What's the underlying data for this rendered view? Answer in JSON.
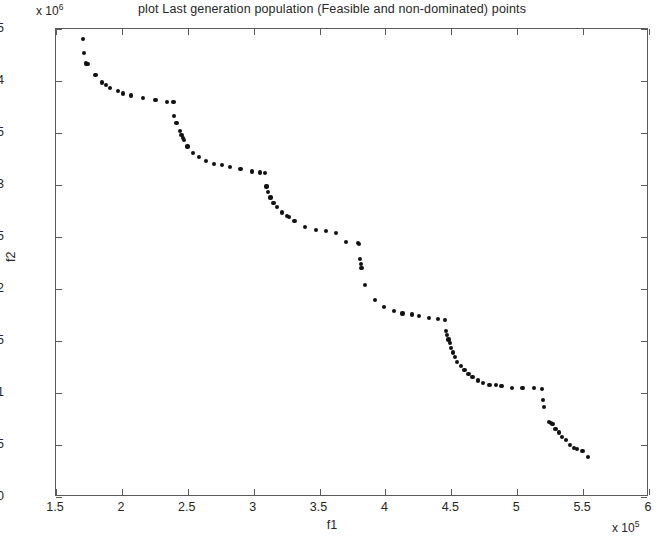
{
  "chart_data": {
    "type": "scatter",
    "title": "plot Last generation population (Feasible and non-dominated) points",
    "xlabel": "f1",
    "ylabel": "f2",
    "x_exponent_label": "x 10",
    "x_exponent_power": "5",
    "y_exponent_label": "x 10",
    "y_exponent_power": "6",
    "xlim": [
      1.5,
      6
    ],
    "ylim": [
      0,
      4.5
    ],
    "xticks": [
      1.5,
      2,
      2.5,
      3,
      3.5,
      4,
      4.5,
      5,
      5.5,
      6
    ],
    "xtick_labels": [
      "1.5",
      "2",
      "2.5",
      "3",
      "3.5",
      "4",
      "4.5",
      "5",
      "5.5",
      "6"
    ],
    "yticks": [
      0,
      0.5,
      1,
      1.5,
      2,
      2.5,
      3,
      3.5,
      4,
      4.5
    ],
    "ytick_labels": [
      "0",
      "0.5",
      "1",
      "1.5",
      "2",
      "2.5",
      "3",
      "3.5",
      "4",
      "4.5"
    ],
    "grid": false,
    "legend": null,
    "marker": "filled-circle",
    "marker_color": "#111111",
    "x_units": "1e5",
    "y_units": "1e6",
    "n_points": 96,
    "points": [
      [
        1.703,
        4.405
      ],
      [
        1.71,
        4.27
      ],
      [
        1.727,
        4.168
      ],
      [
        1.736,
        4.163
      ],
      [
        1.745,
        4.16
      ],
      [
        1.8,
        4.055
      ],
      [
        1.852,
        3.985
      ],
      [
        1.88,
        3.96
      ],
      [
        1.912,
        3.93
      ],
      [
        1.968,
        3.905
      ],
      [
        2.01,
        3.88
      ],
      [
        2.072,
        3.86
      ],
      [
        2.16,
        3.84
      ],
      [
        2.255,
        3.818
      ],
      [
        2.345,
        3.8
      ],
      [
        2.392,
        3.798
      ],
      [
        2.398,
        3.66
      ],
      [
        2.415,
        3.6
      ],
      [
        2.44,
        3.52
      ],
      [
        2.452,
        3.48
      ],
      [
        2.462,
        3.455
      ],
      [
        2.472,
        3.43
      ],
      [
        2.498,
        3.37
      ],
      [
        2.54,
        3.31
      ],
      [
        2.588,
        3.27
      ],
      [
        2.64,
        3.232
      ],
      [
        2.7,
        3.205
      ],
      [
        2.76,
        3.19
      ],
      [
        2.82,
        3.175
      ],
      [
        2.9,
        3.155
      ],
      [
        2.99,
        3.13
      ],
      [
        3.05,
        3.12
      ],
      [
        3.085,
        3.115
      ],
      [
        3.098,
        2.985
      ],
      [
        3.11,
        2.93
      ],
      [
        3.128,
        2.88
      ],
      [
        3.15,
        2.83
      ],
      [
        3.175,
        2.79
      ],
      [
        3.215,
        2.735
      ],
      [
        3.25,
        2.7
      ],
      [
        3.268,
        2.69
      ],
      [
        3.31,
        2.65
      ],
      [
        3.39,
        2.6
      ],
      [
        3.47,
        2.57
      ],
      [
        3.548,
        2.555
      ],
      [
        3.625,
        2.535
      ],
      [
        3.7,
        2.45
      ],
      [
        3.79,
        2.44
      ],
      [
        3.8,
        2.43
      ],
      [
        3.808,
        2.29
      ],
      [
        3.812,
        2.24
      ],
      [
        3.818,
        2.205
      ],
      [
        3.845,
        2.04
      ],
      [
        3.92,
        1.895
      ],
      [
        3.99,
        1.83
      ],
      [
        4.065,
        1.79
      ],
      [
        4.13,
        1.765
      ],
      [
        4.2,
        1.755
      ],
      [
        4.255,
        1.74
      ],
      [
        4.33,
        1.72
      ],
      [
        4.4,
        1.71
      ],
      [
        4.455,
        1.705
      ],
      [
        4.462,
        1.6
      ],
      [
        4.47,
        1.56
      ],
      [
        4.478,
        1.515
      ],
      [
        4.49,
        1.48
      ],
      [
        4.5,
        1.43
      ],
      [
        4.512,
        1.39
      ],
      [
        4.525,
        1.345
      ],
      [
        4.545,
        1.3
      ],
      [
        4.572,
        1.258
      ],
      [
        4.6,
        1.22
      ],
      [
        4.63,
        1.185
      ],
      [
        4.66,
        1.155
      ],
      [
        4.7,
        1.12
      ],
      [
        4.74,
        1.095
      ],
      [
        4.79,
        1.08
      ],
      [
        4.838,
        1.075
      ],
      [
        4.88,
        1.07
      ],
      [
        4.96,
        1.05
      ],
      [
        5.04,
        1.045
      ],
      [
        5.13,
        1.045
      ],
      [
        5.19,
        1.04
      ],
      [
        5.198,
        0.93
      ],
      [
        5.205,
        0.865
      ],
      [
        5.24,
        0.72
      ],
      [
        5.255,
        0.715
      ],
      [
        5.268,
        0.7
      ],
      [
        5.29,
        0.655
      ],
      [
        5.315,
        0.62
      ],
      [
        5.34,
        0.58
      ],
      [
        5.368,
        0.545
      ],
      [
        5.4,
        0.5
      ],
      [
        5.43,
        0.47
      ],
      [
        5.455,
        0.465
      ],
      [
        5.495,
        0.44
      ],
      [
        5.54,
        0.385
      ]
    ]
  }
}
